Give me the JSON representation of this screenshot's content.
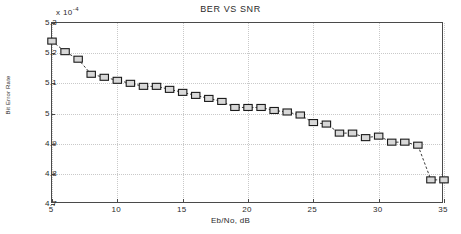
{
  "chart_data": {
    "type": "line",
    "title": "BER VS SNR",
    "xlabel": "Eb/No, dB",
    "ylabel": "Bit Error Rate",
    "y_exponent_label": "x 10",
    "y_exponent_power": "-4",
    "y_scale": 0.0001,
    "xlim": [
      5,
      35
    ],
    "ylim": [
      4.7,
      5.3
    ],
    "grid": true,
    "legend": "none",
    "marker": "square",
    "linestyle": "dashed",
    "xticks": [
      5,
      10,
      15,
      20,
      25,
      30,
      35
    ],
    "yticks": [
      "5.3",
      "5.2",
      "5.1",
      "5",
      "4.9",
      "4.8",
      "4.7"
    ],
    "ytick_values": [
      5.3,
      5.2,
      5.1,
      5.0,
      4.9,
      4.8,
      4.7
    ],
    "series": [
      {
        "name": "BER",
        "x": [
          5,
          6,
          7,
          8,
          9,
          10,
          11,
          12,
          13,
          14,
          15,
          16,
          17,
          18,
          19,
          20,
          21,
          22,
          23,
          24,
          25,
          26,
          27,
          28,
          29,
          30,
          31,
          32,
          33,
          34,
          35
        ],
        "values": [
          5.24,
          5.205,
          5.18,
          5.13,
          5.12,
          5.11,
          5.1,
          5.09,
          5.09,
          5.08,
          5.07,
          5.06,
          5.05,
          5.04,
          5.02,
          5.02,
          5.02,
          5.01,
          5.005,
          4.995,
          4.97,
          4.965,
          4.935,
          4.935,
          4.92,
          4.925,
          4.905,
          4.905,
          4.895,
          4.78,
          4.78
        ]
      }
    ],
    "colors": {
      "line": "#222222",
      "marker_face": "#d8d8d8",
      "marker_edge": "#1a1a1a",
      "grid": "#c9c9c9",
      "axis": "#4a4a4a",
      "background": "#ffffff"
    }
  }
}
